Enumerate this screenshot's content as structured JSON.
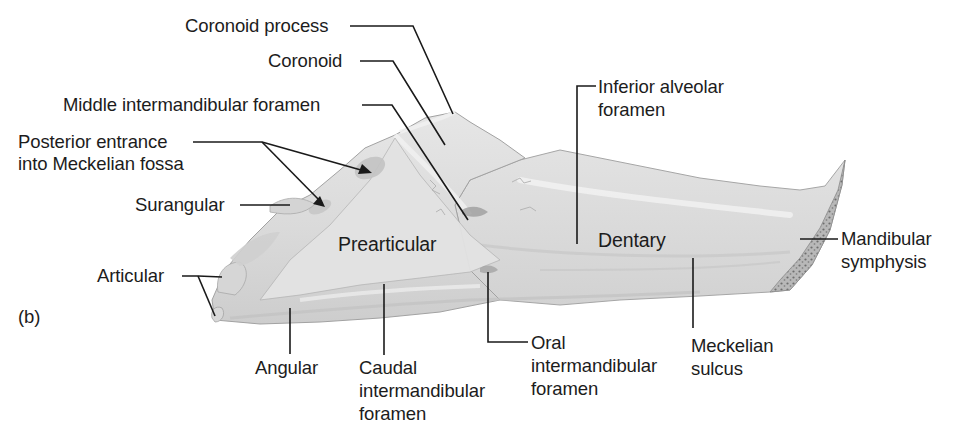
{
  "figure": {
    "panel_label": "(b)",
    "colors": {
      "background": "#ffffff",
      "bone_fill": "#dcdcdc",
      "bone_light": "#e8e8e8",
      "bone_shadow": "#c4c4c4",
      "bone_outline": "#9a9a9a",
      "leader_line": "#1a1a1a",
      "text": "#1c1c1c"
    }
  },
  "labels": {
    "coronoid_process": "Coronoid process",
    "coronoid": "Coronoid",
    "middle_intermandibular_foramen": "Middle intermandibular foramen",
    "posterior_entrance_line1": "Posterior entrance",
    "posterior_entrance_line2": "into Meckelian fossa",
    "surangular": "Surangular",
    "articular": "Articular",
    "prearticular": "Prearticular",
    "dentary": "Dentary",
    "inferior_alveolar_line1": "Inferior alveolar",
    "inferior_alveolar_line2": "foramen",
    "mandibular_symphysis_line1": "Mandibular",
    "mandibular_symphysis_line2": "symphysis",
    "angular": "Angular",
    "caudal_line1": "Caudal",
    "caudal_line2": "intermandibular",
    "caudal_line3": "foramen",
    "oral_line1": "Oral",
    "oral_line2": "intermandibular",
    "oral_line3": "foramen",
    "meckelian_sulcus_line1": "Meckelian",
    "meckelian_sulcus_line2": "sulcus"
  }
}
